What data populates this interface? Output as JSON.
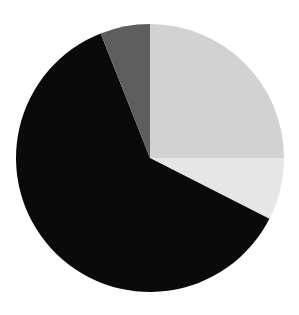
{
  "chart_data": {
    "type": "pie",
    "title": "",
    "subtitle": "",
    "xlabel": "",
    "ylabel": "",
    "grid": false,
    "legend_position": "none",
    "background_color": "#ffffff",
    "center_x": 150,
    "center_y": 158,
    "radius": 134,
    "start_angle_deg": 0,
    "direction": "clockwise",
    "total": 100,
    "labels": [
      "Slice 1",
      "Slice 2",
      "Slice 3",
      "Slice 4"
    ],
    "values": [
      25.0,
      7.5,
      61.5,
      6.0
    ],
    "colors": [
      "#d2d2d2",
      "#e6e6e6",
      "#0a0a0a",
      "#5e5e5e"
    ],
    "slices": [
      {
        "label": "Slice 1",
        "value": 25.0,
        "percent": "25.0%",
        "color": "#d2d2d2",
        "color_name": "light-gray",
        "start_angle_deg": 0,
        "end_angle_deg": 90,
        "sweep_deg": 90,
        "position": "upper-right"
      },
      {
        "label": "Slice 2",
        "value": 7.5,
        "percent": "7.5%",
        "color": "#e6e6e6",
        "color_name": "very-light-gray",
        "start_angle_deg": 90,
        "end_angle_deg": 117,
        "sweep_deg": 27,
        "position": "right-lower"
      },
      {
        "label": "Slice 3",
        "value": 61.5,
        "percent": "61.5%",
        "color": "#0a0a0a",
        "color_name": "black",
        "start_angle_deg": 117,
        "end_angle_deg": 338.4,
        "sweep_deg": 221.4,
        "position": "bottom-left"
      },
      {
        "label": "Slice 4",
        "value": 6.0,
        "percent": "6.0%",
        "color": "#5e5e5e",
        "color_name": "dark-gray",
        "start_angle_deg": 338.4,
        "end_angle_deg": 360,
        "sweep_deg": 21.6,
        "position": "top-left"
      }
    ]
  }
}
